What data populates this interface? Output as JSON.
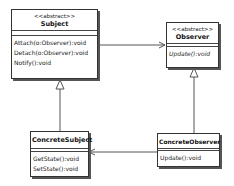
{
  "diagram": {
    "type": "uml-class-diagram",
    "classes": {
      "subject": {
        "stereotype": "<<abstract>>",
        "name": "Subject",
        "operations": [
          "Attach(o:Observer):void",
          "Detach(o:Observer):void",
          "Notify():void"
        ]
      },
      "observer": {
        "stereotype": "<<abstract>>",
        "name": "Observer",
        "operations": [
          "Update():void"
        ]
      },
      "concrete_subject": {
        "name": "ConcreteSubject",
        "operations": [
          "GetState():void",
          "SetState():void"
        ]
      },
      "concrete_observer": {
        "name": "ConcreteObserver",
        "operations": [
          "Update():void"
        ]
      }
    },
    "relationships": [
      {
        "from": "Subject",
        "to": "Observer",
        "kind": "association"
      },
      {
        "from": "ConcreteSubject",
        "to": "Subject",
        "kind": "generalization"
      },
      {
        "from": "ConcreteObserver",
        "to": "Observer",
        "kind": "generalization"
      },
      {
        "from": "ConcreteObserver",
        "to": "ConcreteSubject",
        "kind": "association"
      }
    ],
    "colors": {
      "line": "#444444",
      "border": "#333333",
      "shadow": "#555555",
      "background": "#ffffff"
    }
  }
}
